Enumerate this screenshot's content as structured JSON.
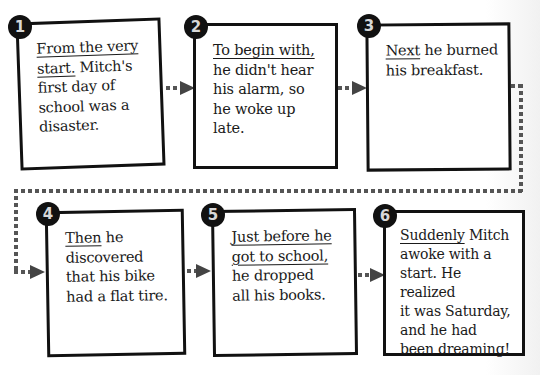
{
  "steps": [
    {
      "number": "1",
      "transition": "From the very start.",
      "lines": [
        "From the very",
        "start.",
        " Mitch's",
        "first day of",
        "school was a",
        "disaster."
      ]
    },
    {
      "number": "2",
      "transition": "To begin with,",
      "lines": [
        "To begin with,",
        "he didn't hear",
        "his alarm, so",
        "he woke up late."
      ]
    },
    {
      "number": "3",
      "transition": "Next",
      "lines": [
        "Next",
        " he burned",
        "his breakfast."
      ]
    },
    {
      "number": "4",
      "transition": "Then",
      "lines": [
        "Then",
        " he",
        "discovered",
        "that his bike",
        "had a flat tire."
      ]
    },
    {
      "number": "5",
      "transition": "Just before he got to school,",
      "lines": [
        "Just before he",
        "got to school,",
        "he dropped",
        "all his books."
      ]
    },
    {
      "number": "6",
      "transition": "Suddenly",
      "lines": [
        "Suddenly",
        " Mitch",
        "awoke with a",
        "start. He realized",
        "it was Saturday,",
        "and he had",
        "been dreaming!"
      ]
    }
  ],
  "colors": {
    "box_border": "#111111",
    "badge_fill": "#111111",
    "badge_text": "#d8d8d8",
    "connector": "#555555",
    "arrow": "#444444"
  }
}
